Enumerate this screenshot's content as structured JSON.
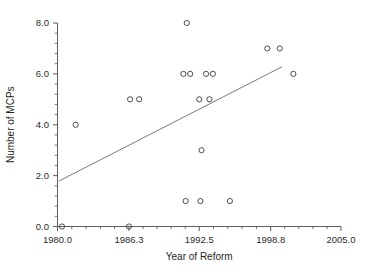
{
  "chart_data": {
    "type": "scatter",
    "title": "",
    "xlabel": "Year of Reform",
    "ylabel": "Number of MCPs",
    "xlim": [
      1980.0,
      2005.0
    ],
    "ylim": [
      0.0,
      8.0
    ],
    "grid": false,
    "legend": null,
    "xticks": [
      "1980.0",
      "1986.3",
      "1992.5",
      "1998.8",
      "2005.0"
    ],
    "xtick_values": [
      1980.0,
      1986.3,
      1992.5,
      1998.8,
      2005.0
    ],
    "yticks": [
      "0.0",
      "2.0",
      "4.0",
      "6.0",
      "8.0"
    ],
    "ytick_values": [
      0.0,
      2.0,
      4.0,
      6.0,
      8.0
    ],
    "x_minor_tick_count": 4,
    "y_minor_tick_count": 4,
    "marker": "open-circle",
    "marker_color": "#3a3a3a",
    "points": [
      {
        "x": 1980.4,
        "y": 0.0
      },
      {
        "x": 1986.3,
        "y": 0.0
      },
      {
        "x": 1981.6,
        "y": 4.0
      },
      {
        "x": 1986.4,
        "y": 5.0
      },
      {
        "x": 1987.2,
        "y": 5.0
      },
      {
        "x": 1991.4,
        "y": 8.0
      },
      {
        "x": 1991.3,
        "y": 1.0
      },
      {
        "x": 1992.6,
        "y": 1.0
      },
      {
        "x": 1995.2,
        "y": 1.0
      },
      {
        "x": 1992.7,
        "y": 3.0
      },
      {
        "x": 1992.5,
        "y": 5.0
      },
      {
        "x": 1993.4,
        "y": 5.0
      },
      {
        "x": 1991.1,
        "y": 6.0
      },
      {
        "x": 1991.7,
        "y": 6.0
      },
      {
        "x": 1993.1,
        "y": 6.0
      },
      {
        "x": 1993.7,
        "y": 6.0
      },
      {
        "x": 2000.8,
        "y": 6.0
      },
      {
        "x": 1998.5,
        "y": 7.0
      },
      {
        "x": 1999.6,
        "y": 7.0
      }
    ],
    "trendline": {
      "type": "linear-fit",
      "color": "#6b6b6b",
      "x_start": 1980.1,
      "y_start": 1.78,
      "x_end": 1999.8,
      "y_end": 6.28
    }
  }
}
